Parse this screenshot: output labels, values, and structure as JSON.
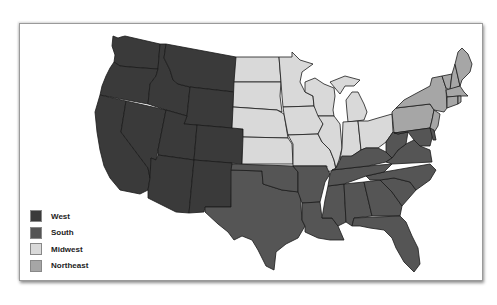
{
  "map": {
    "title": "United States Census Regions",
    "colors": {
      "West": "#3a3a3a",
      "South": "#555555",
      "Midwest": "#d9d9d9",
      "Northeast": "#a6a6a6"
    }
  },
  "legend": {
    "items": [
      {
        "label": "West",
        "color": "#3a3a3a"
      },
      {
        "label": "South",
        "color": "#555555"
      },
      {
        "label": "Midwest",
        "color": "#d9d9d9"
      },
      {
        "label": "Northeast",
        "color": "#a6a6a6"
      }
    ]
  }
}
